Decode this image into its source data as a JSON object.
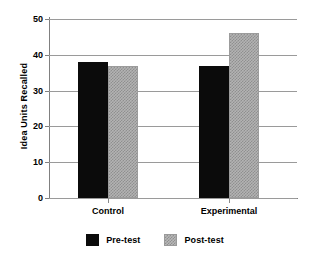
{
  "chart_data": {
    "type": "bar",
    "title": "",
    "xlabel": "",
    "ylabel": "Idea Units Recalled",
    "categories": [
      "Control",
      "Experimental"
    ],
    "series": [
      {
        "name": "Pre-test",
        "values": [
          38,
          37
        ],
        "color": "#0b0b0b"
      },
      {
        "name": "Post-test",
        "values": [
          37,
          46
        ],
        "color": "#b3b3b3"
      }
    ],
    "ylim": [
      0,
      50
    ],
    "yticks": [
      0,
      10,
      20,
      30,
      40,
      50
    ],
    "ytick_labels": [
      "0",
      "10",
      "20",
      "30",
      "40",
      "50"
    ],
    "grid": true,
    "legend_position": "bottom"
  },
  "axis": {
    "y_title": "Idea Units Recalled",
    "ticks": [
      {
        "label": "50",
        "value": 50
      },
      {
        "label": "40",
        "value": 40
      },
      {
        "label": "30",
        "value": 30
      },
      {
        "label": "20",
        "value": 20
      },
      {
        "label": "10",
        "value": 10
      },
      {
        "label": "0",
        "value": 0
      }
    ]
  },
  "categories": [
    {
      "label": "Control"
    },
    {
      "label": "Experimental"
    }
  ],
  "legend": {
    "items": [
      {
        "label": "Pre-test",
        "swatch": "black-solid"
      },
      {
        "label": "Post-test",
        "swatch": "gray-checkered"
      }
    ]
  }
}
